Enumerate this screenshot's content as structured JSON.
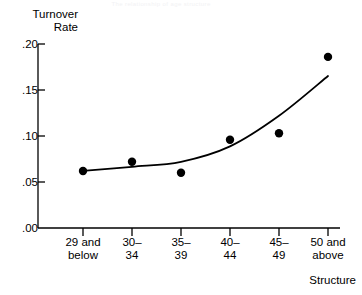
{
  "figure": {
    "faint_header": "The relationship of age structure",
    "y_axis_title": "Turnover\nRate",
    "x_axis_title": "Structure"
  },
  "chart_data": {
    "type": "scatter",
    "title": "",
    "subtitle": "",
    "xlabel": "Structure",
    "ylabel": "Turnover Rate",
    "categories": [
      "29 and\nbelow",
      "30–\n34",
      "35–\n39",
      "40–\n44",
      "45–\n49",
      "50 and\nabove"
    ],
    "values": [
      0.062,
      0.072,
      0.06,
      0.096,
      0.103,
      0.186
    ],
    "y_ticks": [
      ".00",
      ".05",
      ".10",
      ".15",
      ".20"
    ],
    "y_tick_values": [
      0.0,
      0.05,
      0.1,
      0.15,
      0.2
    ],
    "ylim": [
      0.0,
      0.2
    ],
    "grid": "off",
    "legend": "none",
    "marker": "filled-circle",
    "marker_color": "#000000",
    "fit_line": {
      "present": true,
      "style": "smooth-curve",
      "color": "#000000",
      "description": "fitted curve rising from ~.062 at left, flat through mid categories, steeply increasing to ~.186 at right"
    },
    "axis_color": "#000000"
  }
}
